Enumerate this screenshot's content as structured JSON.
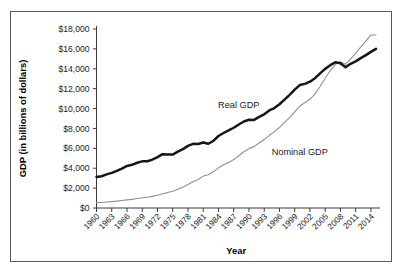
{
  "chart_data": {
    "type": "line",
    "title": "",
    "xlabel": "Year",
    "ylabel": "GDP (in billions of dollars)",
    "xlim": [
      1960,
      2015
    ],
    "ylim": [
      0,
      18000
    ],
    "grid": false,
    "legend_position": "inline-annotations",
    "y_ticks": [
      0,
      2000,
      4000,
      6000,
      8000,
      10000,
      12000,
      14000,
      16000,
      18000
    ],
    "y_tick_labels": [
      "$0",
      "$2,000",
      "$4,000",
      "$6,000",
      "$8,000",
      "$10,000",
      "$12,000",
      "$14,000",
      "$16,000",
      "$18,000"
    ],
    "x_ticks": [
      1960,
      1963,
      1966,
      1969,
      1972,
      1975,
      1978,
      1981,
      1984,
      1987,
      1990,
      1993,
      1996,
      1999,
      2002,
      2005,
      2008,
      2011,
      2014
    ],
    "x_tick_labels": [
      "1960",
      "1963",
      "1966",
      "1969",
      "1972",
      "1975",
      "1978",
      "1981",
      "1984",
      "1987",
      "1990",
      "1993",
      "1996",
      "1999",
      "2002",
      "2005",
      "2008",
      "2011",
      "2014"
    ],
    "annotations": [
      {
        "text": "Real GDP",
        "x": 1988,
        "y": 10100
      },
      {
        "text": "Nominal GDP",
        "x": 2000,
        "y": 5300
      }
    ],
    "x": [
      1960,
      1961,
      1962,
      1963,
      1964,
      1965,
      1966,
      1967,
      1968,
      1969,
      1970,
      1971,
      1972,
      1973,
      1974,
      1975,
      1976,
      1977,
      1978,
      1979,
      1980,
      1981,
      1982,
      1983,
      1984,
      1985,
      1986,
      1987,
      1988,
      1989,
      1990,
      1991,
      1992,
      1993,
      1994,
      1995,
      1996,
      1997,
      1998,
      1999,
      2000,
      2001,
      2002,
      2003,
      2004,
      2005,
      2006,
      2007,
      2008,
      2009,
      2010,
      2011,
      2012,
      2013,
      2014,
      2015
    ],
    "series": [
      {
        "name": "Real GDP",
        "color": "#15161a",
        "style": "thick-solid",
        "values": [
          3110,
          3190,
          3380,
          3530,
          3730,
          3970,
          4230,
          4340,
          4550,
          4690,
          4700,
          4860,
          5120,
          5410,
          5380,
          5370,
          5660,
          5920,
          6250,
          6450,
          6430,
          6590,
          6460,
          6750,
          7240,
          7540,
          7810,
          8070,
          8400,
          8700,
          8870,
          8860,
          9170,
          9420,
          9810,
          10050,
          10430,
          10900,
          11370,
          11900,
          12360,
          12480,
          12700,
          13050,
          13540,
          13990,
          14360,
          14660,
          14560,
          14150,
          14500,
          14750,
          15070,
          15370,
          15700,
          16000
        ]
      },
      {
        "name": "Nominal GDP",
        "color": "#8c8f93",
        "style": "thin-solid",
        "values": [
          540,
          560,
          600,
          640,
          690,
          750,
          820,
          870,
          950,
          1030,
          1080,
          1170,
          1280,
          1430,
          1550,
          1690,
          1880,
          2090,
          2360,
          2630,
          2860,
          3210,
          3340,
          3640,
          4040,
          4340,
          4580,
          4870,
          5250,
          5660,
          5980,
          6170,
          6540,
          6880,
          7310,
          7660,
          8100,
          8610,
          9090,
          9660,
          10250,
          10580,
          10940,
          11460,
          12220,
          13040,
          13820,
          14450,
          14710,
          14450,
          14990,
          15540,
          16200,
          16790,
          17400,
          17400
        ]
      }
    ]
  }
}
